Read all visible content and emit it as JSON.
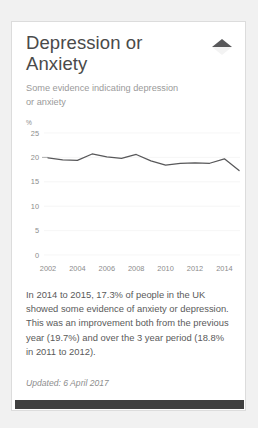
{
  "card": {
    "title": "Depression or Anxiety",
    "subtitle": "Some evidence indicating depression or anxiety",
    "collapse_icon": "collapse-triangle-icon",
    "body_text": "In 2014 to 2015, 17.3% of people in the UK showed some evidence of anxiety or depression. This was an improvement both from the previous year (19.7%) and over the 3 year period (18.8% in 2011 to 2012).",
    "updated_label": "Updated: 6 April 2017"
  },
  "colors": {
    "page_background": "#f1f1f1",
    "card_background": "#ffffff",
    "card_border": "#dcdcdc",
    "title_text": "#4a4a4a",
    "subtitle_text": "#9a9a9a",
    "body_text": "#5a5a5a",
    "line_series": "#58585a",
    "gridline": "#f2f2f2",
    "axis_text": "#8c8c8c",
    "bottom_bar": "#404040"
  },
  "chart_data": {
    "type": "line",
    "title": "",
    "xlabel": "",
    "ylabel": "",
    "yunit": "%",
    "ylim": [
      0,
      25
    ],
    "yticks": [
      0,
      5,
      10,
      15,
      20,
      25
    ],
    "ytick_labels": [
      "0",
      "5",
      "10",
      "15",
      "20",
      "25"
    ],
    "xlim": [
      2002,
      2015
    ],
    "xticks": [
      2002,
      2004,
      2006,
      2008,
      2010,
      2012,
      2014
    ],
    "xtick_labels": [
      "2002",
      "2004",
      "2006",
      "2008",
      "2010",
      "2012",
      "2014"
    ],
    "grid": true,
    "legend": "none",
    "x": [
      2002,
      2003,
      2004,
      2005,
      2006,
      2007,
      2008,
      2009,
      2010,
      2011,
      2012,
      2013,
      2014,
      2015
    ],
    "series": [
      {
        "name": "Some evidence indicating depression or anxiety",
        "values": [
          19.9,
          19.5,
          19.4,
          20.7,
          20.1,
          19.8,
          20.6,
          19.3,
          18.4,
          18.8,
          18.9,
          18.8,
          19.7,
          17.3
        ]
      }
    ]
  }
}
